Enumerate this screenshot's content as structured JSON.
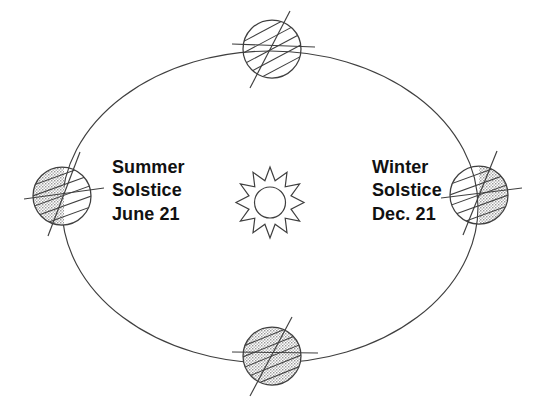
{
  "diagram": {
    "background_color": "#ffffff",
    "stroke_color": "#3a3a3a",
    "text_color": "#111111",
    "shade_color": "#b8b8b8"
  },
  "sun": {
    "name": "Sun",
    "icon": "sun-icon",
    "center_x": 270,
    "center_y": 193,
    "outer_radius": 26,
    "inner_radius": 16,
    "core_radius": 13,
    "points": 12
  },
  "orbit": {
    "name": "Earth orbital path",
    "center_x": 270,
    "center_y": 207,
    "radius_x": 208,
    "radius_y": 156
  },
  "labels": {
    "summer": {
      "line1": "Summer",
      "line2": "Solstice",
      "line3": "June 21"
    },
    "winter": {
      "line1": "Winter",
      "line2": "Solstice",
      "line3": "Dec. 21"
    }
  },
  "earths": [
    {
      "id": "earth-top",
      "position": "top",
      "center_x": 272,
      "center_y": 49,
      "radius": 29,
      "axis_tilt_deg": 23.5,
      "shading": "none",
      "shaded_side": "",
      "latitude_lines": 5
    },
    {
      "id": "earth-left",
      "position": "left-summer-solstice",
      "center_x": 62,
      "center_y": 196,
      "radius": 29,
      "axis_tilt_deg": 23.5,
      "shading": "partial",
      "shaded_side": "left",
      "latitude_lines": 5
    },
    {
      "id": "earth-right",
      "position": "right-winter-solstice",
      "center_x": 479,
      "center_y": 195,
      "radius": 29,
      "axis_tilt_deg": 23.5,
      "shading": "partial",
      "shaded_side": "right",
      "latitude_lines": 5
    },
    {
      "id": "earth-bottom",
      "position": "bottom",
      "center_x": 272,
      "center_y": 356,
      "radius": 29,
      "axis_tilt_deg": 23.5,
      "shading": "full",
      "shaded_side": "all",
      "latitude_lines": 5
    }
  ]
}
